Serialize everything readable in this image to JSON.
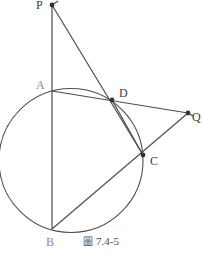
{
  "figure": {
    "caption_glyph": "圖",
    "caption_text": "7.4-5",
    "stroke_color": "#4d4d4d",
    "label_color": "#3d3d3d",
    "faint_label_color": "#8a8a8a",
    "background": "#ffffff"
  },
  "points": [
    {
      "name": "P",
      "label": "P",
      "x": 52,
      "y": 5,
      "label_x": 36,
      "label_y": 0,
      "marker": true,
      "faint": false
    },
    {
      "name": "A",
      "label": "A",
      "x": 52,
      "y": 91,
      "label_x": 36,
      "label_y": 80,
      "marker": false,
      "faint": true
    },
    {
      "name": "D",
      "label": "D",
      "x": 112,
      "y": 100,
      "label_x": 119,
      "label_y": 88,
      "marker": true,
      "faint": false
    },
    {
      "name": "Q",
      "label": "Q",
      "x": 188,
      "y": 113,
      "label_x": 192,
      "label_y": 112,
      "marker": true,
      "faint": false
    },
    {
      "name": "C",
      "label": "C",
      "x": 143,
      "y": 155,
      "label_x": 150,
      "label_y": 156,
      "marker": true,
      "faint": false
    },
    {
      "name": "B",
      "label": "B",
      "x": 52,
      "y": 229,
      "label_x": 46,
      "label_y": 237,
      "marker": false,
      "faint": true
    }
  ],
  "circle": {
    "name": "main-circle",
    "cx": 71,
    "cy": 160.5,
    "r": 72,
    "left": 3,
    "right": 139,
    "top": 88,
    "bottom": 233
  },
  "segments": [
    {
      "name": "segment-P-B",
      "from": "P",
      "to": "B",
      "x1": 52,
      "y1": 5,
      "x2": 52,
      "y2": 229,
      "note": "vertical line through A"
    },
    {
      "name": "segment-P-C",
      "from": "P",
      "to": "C",
      "x1": 52,
      "y1": 5,
      "x2": 143,
      "y2": 155,
      "note": "secant P-D-C"
    },
    {
      "name": "segment-A-Q",
      "from": "A",
      "to": "Q",
      "x1": 52,
      "y1": 91,
      "x2": 188,
      "y2": 113,
      "note": "secant A-D-Q"
    },
    {
      "name": "segment-B-Q",
      "from": "B",
      "to": "Q",
      "x1": 52,
      "y1": 229,
      "x2": 188,
      "y2": 113,
      "note": "secant B-C-Q"
    },
    {
      "name": "chord-D-C",
      "from": "D",
      "to": "C",
      "x1": 112,
      "y1": 100,
      "x2": 143,
      "y2": 155,
      "note": "chord DC"
    }
  ],
  "arrow_tips": [
    {
      "name": "arrow-tip-P",
      "at": "P",
      "x": 57,
      "y": 1
    },
    {
      "name": "arrow-tip-Q",
      "at": "Q",
      "x": 191,
      "y": 115
    }
  ]
}
